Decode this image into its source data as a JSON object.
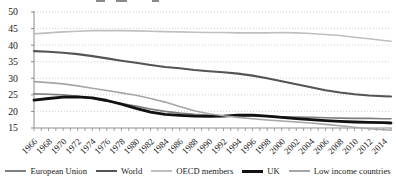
{
  "figure": {
    "background": "#ffffff",
    "text_color": "#1a1a1a",
    "gridline_color": "#c9c9c9",
    "axis_color": "#8c8c8c"
  },
  "chart_data": {
    "type": "line",
    "title": "",
    "xlabel": "",
    "ylabel": "",
    "xlim": [
      1966,
      2015
    ],
    "ylim": [
      15,
      50
    ],
    "yticks": [
      15,
      20,
      25,
      30,
      35,
      40,
      45,
      50
    ],
    "xtick_labels": [
      "1966",
      "1968",
      "1970",
      "1972",
      "1974",
      "1976",
      "1978",
      "1980",
      "1982",
      "1984",
      "1986",
      "1988",
      "1990",
      "1992",
      "1994",
      "1996",
      "1998",
      "2000",
      "2002",
      "2004",
      "2006",
      "2008",
      "2010",
      "2012",
      "2014"
    ],
    "grid": "horizontal-dotted",
    "legend_position": "bottom",
    "x": [
      1966,
      1968,
      1970,
      1972,
      1974,
      1976,
      1978,
      1980,
      1982,
      1984,
      1986,
      1988,
      1990,
      1992,
      1994,
      1996,
      1998,
      2000,
      2002,
      2004,
      2006,
      2008,
      2010,
      2012,
      2014,
      2015
    ],
    "series": [
      {
        "name": "European Union",
        "color": "#7f7f7f",
        "width": 1.6,
        "values": [
          25.3,
          25.2,
          25.0,
          24.6,
          23.9,
          23.1,
          22.4,
          21.6,
          20.7,
          20.0,
          19.5,
          19.1,
          18.9,
          18.7,
          18.6,
          18.6,
          18.5,
          18.4,
          18.3,
          18.2,
          18.1,
          18.0,
          17.9,
          17.9,
          17.8,
          17.8
        ]
      },
      {
        "name": "World",
        "color": "#545454",
        "width": 2.1,
        "values": [
          38.2,
          38.0,
          37.7,
          37.3,
          36.7,
          36.0,
          35.3,
          34.7,
          34.0,
          33.4,
          33.0,
          32.5,
          32.1,
          31.8,
          31.4,
          30.8,
          30.0,
          29.1,
          28.2,
          27.3,
          26.4,
          25.7,
          25.2,
          24.8,
          24.6,
          24.5
        ]
      },
      {
        "name": "OECD members",
        "color": "#bfbfbf",
        "width": 1.6,
        "values": [
          43.4,
          43.7,
          44.0,
          44.2,
          44.4,
          44.4,
          44.4,
          44.3,
          44.2,
          44.1,
          44.0,
          43.9,
          43.8,
          43.8,
          43.7,
          43.7,
          43.7,
          43.8,
          43.7,
          43.5,
          43.2,
          42.9,
          42.4,
          41.9,
          41.4,
          41.2
        ]
      },
      {
        "name": "UK",
        "color": "#111111",
        "width": 2.8,
        "values": [
          23.4,
          23.9,
          24.3,
          24.4,
          24.1,
          23.3,
          22.2,
          20.9,
          19.8,
          19.1,
          18.8,
          18.6,
          18.5,
          18.6,
          18.9,
          18.9,
          18.6,
          18.2,
          17.8,
          17.5,
          17.2,
          17.0,
          16.8,
          16.7,
          16.6,
          16.5
        ]
      },
      {
        "name": "Low income countries",
        "color": "#a6a6a6",
        "width": 1.6,
        "values": [
          29.0,
          28.7,
          28.3,
          27.7,
          27.0,
          26.3,
          25.6,
          24.9,
          23.9,
          22.8,
          21.5,
          20.2,
          19.3,
          18.7,
          18.2,
          17.8,
          17.4,
          17.1,
          16.8,
          16.5,
          16.1,
          15.7,
          15.2,
          14.8,
          14.5,
          14.3
        ]
      }
    ]
  }
}
